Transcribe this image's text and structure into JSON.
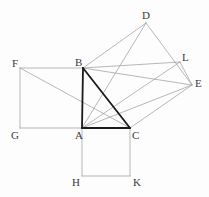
{
  "figure": {
    "canvas": {
      "width": 209,
      "height": 197
    },
    "colors": {
      "background": "#fdfdfd",
      "thick_stroke": "#1a1a1a",
      "thin_stroke": "#9a9a9a",
      "label_text": "#3a3a3a"
    },
    "stroke_widths": {
      "thick": 1.8,
      "thin": 0.7
    },
    "points": {
      "A": {
        "x": 82,
        "y": 128,
        "label": "A",
        "label_x": 75,
        "label_y": 130
      },
      "B": {
        "x": 83,
        "y": 68,
        "label": "B",
        "label_x": 75,
        "label_y": 57
      },
      "C": {
        "x": 130,
        "y": 128,
        "label": "C",
        "label_x": 132,
        "label_y": 130
      },
      "D": {
        "x": 146,
        "y": 23,
        "label": "D",
        "label_x": 142,
        "label_y": 10
      },
      "E": {
        "x": 192,
        "y": 85,
        "label": "E",
        "label_x": 195,
        "label_y": 78
      },
      "F": {
        "x": 20,
        "y": 68,
        "label": "F",
        "label_x": 12,
        "label_y": 58
      },
      "G": {
        "x": 20,
        "y": 128,
        "label": "G",
        "label_x": 11,
        "label_y": 130
      },
      "H": {
        "x": 82,
        "y": 176,
        "label": "H",
        "label_x": 72,
        "label_y": 177
      },
      "K": {
        "x": 130,
        "y": 176,
        "label": "K",
        "label_x": 133,
        "label_y": 177
      },
      "L": {
        "x": 180,
        "y": 62,
        "label": "L",
        "label_x": 182,
        "label_y": 52
      }
    },
    "thick_paths": [
      {
        "name": "triangle-side-AB",
        "from": "A",
        "to": "B"
      },
      {
        "name": "triangle-side-AC",
        "from": "A",
        "to": "C"
      },
      {
        "name": "triangle-hypotenuse-BC",
        "from": "B",
        "to": "C"
      }
    ],
    "thin_paths": [
      {
        "name": "square-ABFG-side-BF",
        "from": "B",
        "to": "F"
      },
      {
        "name": "square-ABFG-side-FG",
        "from": "F",
        "to": "G"
      },
      {
        "name": "square-ABFG-side-GA",
        "from": "G",
        "to": "A"
      },
      {
        "name": "square-ACKH-side-AH",
        "from": "A",
        "to": "H"
      },
      {
        "name": "square-ACKH-side-HK",
        "from": "H",
        "to": "K"
      },
      {
        "name": "square-ACKH-side-KC",
        "from": "K",
        "to": "C"
      },
      {
        "name": "square-BDEC-side-BD",
        "from": "B",
        "to": "D"
      },
      {
        "name": "square-BDEC-side-DE",
        "from": "D",
        "to": "E"
      },
      {
        "name": "square-BDEC-side-EC",
        "from": "E",
        "to": "C"
      },
      {
        "name": "square-BLEC-side-BL",
        "from": "B",
        "to": "L"
      },
      {
        "name": "square-BLEC-side-LE",
        "from": "L",
        "to": "E"
      },
      {
        "name": "construction-line-AD",
        "from": "A",
        "to": "D"
      },
      {
        "name": "construction-line-AE",
        "from": "A",
        "to": "E"
      },
      {
        "name": "construction-line-AL",
        "from": "A",
        "to": "L"
      },
      {
        "name": "construction-line-FC",
        "from": "F",
        "to": "C"
      },
      {
        "name": "construction-line-BE",
        "from": "B",
        "to": "E"
      }
    ],
    "labels_order": [
      "D",
      "F",
      "B",
      "L",
      "E",
      "G",
      "A",
      "C",
      "H",
      "K"
    ]
  }
}
